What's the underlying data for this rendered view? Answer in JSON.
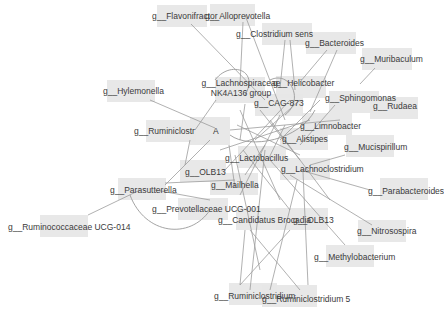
{
  "diagram": {
    "type": "network",
    "background": "#ffffff",
    "node_fill": "#e6e6e6",
    "edge_color": "#9a9a9a",
    "label_color": "#3a3a3a",
    "nodes": [
      {
        "id": "flavonifractor",
        "label": "g__Flavonifractor",
        "box": [
          157,
          5,
          50,
          22
        ],
        "text": [
          152,
          11
        ]
      },
      {
        "id": "alloprevotella",
        "label": "g__Alloprevotella",
        "box": [
          210,
          4,
          45,
          22
        ],
        "text": [
          205,
          11
        ]
      },
      {
        "id": "clostridium",
        "label": "g__Clostridium sens",
        "box": [
          262,
          23,
          50,
          22
        ],
        "text": [
          236,
          29
        ]
      },
      {
        "id": "bacteroides",
        "label": "g__Bacteroides",
        "box": [
          306,
          32,
          50,
          22
        ],
        "text": [
          305,
          38
        ]
      },
      {
        "id": "muribaculum",
        "label": "g__Muribaculum",
        "box": [
          362,
          48,
          50,
          22
        ],
        "text": [
          360,
          54
        ]
      },
      {
        "id": "hylemonella",
        "label": "g__Hylemonella",
        "box": [
          107,
          80,
          48,
          22
        ],
        "text": [
          103,
          86
        ]
      },
      {
        "id": "lachnospiraceae",
        "label": "g__Lachnospiraceae NK4A136 group",
        "box": [
          215,
          77,
          50,
          26
        ],
        "text": [
          185,
          78
        ]
      },
      {
        "id": "helicobacter",
        "label": "g__Helicobacter",
        "box": [
          276,
          76,
          50,
          22
        ],
        "text": [
          273,
          78
        ]
      },
      {
        "id": "cag873",
        "label": "g__CAG-873",
        "box": [
          255,
          94,
          48,
          22
        ],
        "text": [
          254,
          98
        ]
      },
      {
        "id": "sphingomonas",
        "label": "g__Sphingomonas",
        "box": [
          329,
          91,
          50,
          22
        ],
        "text": [
          325,
          93
        ]
      },
      {
        "id": "rudaea",
        "label": "g__Rudaea",
        "box": [
          370,
          97,
          48,
          22
        ],
        "text": [
          373,
          101
        ]
      },
      {
        "id": "ruminiclostr",
        "label": "g__Ruminiclostr",
        "box": [
          146,
          120,
          50,
          22
        ],
        "text": [
          134,
          126
        ]
      },
      {
        "id": "a",
        "label": "A",
        "box": [
          190,
          117,
          40,
          28
        ],
        "text": [
          213,
          126
        ]
      },
      {
        "id": "limnobacter",
        "label": "g__Limnobacter",
        "box": [
          302,
          113,
          50,
          22
        ],
        "text": [
          300,
          121
        ]
      },
      {
        "id": "alistipes",
        "label": "g__Alistipes",
        "box": [
          280,
          128,
          48,
          22
        ],
        "text": [
          282,
          134
        ]
      },
      {
        "id": "mucispirillum",
        "label": "g__Mucispirillum",
        "box": [
          346,
          135,
          48,
          22
        ],
        "text": [
          344,
          142
        ]
      },
      {
        "id": "lactobacillus",
        "label": "g__Lactobacillus",
        "box": [
          238,
          146,
          48,
          22
        ],
        "text": [
          225,
          153
        ]
      },
      {
        "id": "lachnoclostridium",
        "label": "g__Lachnoclostridium",
        "box": [
          280,
          158,
          50,
          22
        ],
        "text": [
          281,
          164
        ]
      },
      {
        "id": "olb13",
        "label": "g__OLB13",
        "box": [
          180,
          160,
          46,
          22
        ],
        "text": [
          185,
          167
        ]
      },
      {
        "id": "mailhella",
        "label": "g__Mailhella",
        "box": [
          210,
          173,
          48,
          22
        ],
        "text": [
          211,
          180
        ]
      },
      {
        "id": "parabacteroides",
        "label": "g__Parabacteroides",
        "box": [
          380,
          178,
          48,
          22
        ],
        "text": [
          368,
          186
        ]
      },
      {
        "id": "parasutterella",
        "label": "g__Parasutterella",
        "box": [
          118,
          178,
          48,
          22
        ],
        "text": [
          110,
          185
        ]
      },
      {
        "id": "prevotellaceae",
        "label": "g__Prevotellaceae UCG-001",
        "box": [
          178,
          198,
          50,
          22
        ],
        "text": [
          152,
          204
        ]
      },
      {
        "id": "candidatus",
        "label": "g__Candidatus Brocadia",
        "box": [
          236,
          208,
          50,
          22
        ],
        "text": [
          218,
          215
        ]
      },
      {
        "id": "olb13b",
        "label": "g__OLB13",
        "box": [
          276,
          208,
          52,
          22
        ],
        "text": [
          293,
          215
        ]
      },
      {
        "id": "nitrosospira",
        "label": "g__Nitrosospira",
        "box": [
          358,
          220,
          48,
          22
        ],
        "text": [
          357,
          226
        ]
      },
      {
        "id": "ruminococcaceae",
        "label": "g__Ruminococcaceae UCG-014",
        "box": [
          40,
          215,
          48,
          22
        ],
        "text": [
          8,
          222
        ]
      },
      {
        "id": "methylobacterium",
        "label": "g__Methylobacterium",
        "box": [
          326,
          245,
          48,
          22
        ],
        "text": [
          314,
          252
        ]
      },
      {
        "id": "ruminiclostridium",
        "label": "g__Ruminiclostridium",
        "box": [
          229,
          283,
          48,
          22
        ],
        "text": [
          214,
          291
        ]
      },
      {
        "id": "ruminiclostridium5",
        "label": "g__Ruminiclostridium 5",
        "box": [
          262,
          285,
          55,
          22
        ],
        "text": [
          262,
          294
        ]
      }
    ],
    "edges": [
      [
        191,
        24,
        265,
        100
      ],
      [
        243,
        22,
        240,
        85
      ],
      [
        245,
        15,
        285,
        120
      ],
      [
        285,
        40,
        280,
        88
      ],
      [
        290,
        40,
        295,
        90
      ],
      [
        327,
        50,
        300,
        82
      ],
      [
        337,
        50,
        310,
        112
      ],
      [
        375,
        68,
        360,
        84
      ],
      [
        150,
        100,
        215,
        128
      ],
      [
        216,
        100,
        195,
        130
      ],
      [
        245,
        104,
        240,
        140
      ],
      [
        260,
        110,
        300,
        160
      ],
      [
        229,
        145,
        235,
        188
      ],
      [
        210,
        140,
        165,
        185
      ],
      [
        190,
        140,
        185,
        165
      ],
      [
        230,
        130,
        340,
        120
      ],
      [
        237,
        125,
        300,
        155
      ],
      [
        243,
        150,
        290,
        210
      ],
      [
        235,
        155,
        260,
        270
      ],
      [
        300,
        170,
        370,
        190
      ],
      [
        310,
        165,
        345,
        155
      ],
      [
        320,
        100,
        280,
        140
      ],
      [
        335,
        105,
        300,
        145
      ],
      [
        285,
        125,
        268,
        160
      ],
      [
        265,
        150,
        250,
        290
      ],
      [
        270,
        160,
        345,
        245
      ],
      [
        290,
        175,
        372,
        225
      ],
      [
        303,
        172,
        308,
        285
      ],
      [
        297,
        180,
        270,
        290
      ],
      [
        245,
        230,
        240,
        285
      ],
      [
        250,
        230,
        300,
        290
      ],
      [
        290,
        230,
        240,
        285
      ],
      [
        155,
        190,
        210,
        200
      ],
      [
        88,
        215,
        140,
        190
      ],
      [
        165,
        183,
        235,
        180
      ],
      [
        280,
        115,
        240,
        195
      ],
      [
        290,
        100,
        225,
        170
      ],
      [
        270,
        120,
        330,
        200
      ],
      [
        255,
        140,
        300,
        100
      ],
      [
        220,
        150,
        310,
        120
      ],
      [
        265,
        145,
        245,
        175
      ],
      [
        240,
        110,
        280,
        200
      ]
    ],
    "curves": [
      "M 215 80 C 230 60, 260 70, 245 95",
      "M 230 135 C 250 150, 300 140, 315 110",
      "M 130 195 C 145 235, 190 240, 210 210",
      "M 270 80 C 290 70, 305 100, 285 115"
    ]
  }
}
